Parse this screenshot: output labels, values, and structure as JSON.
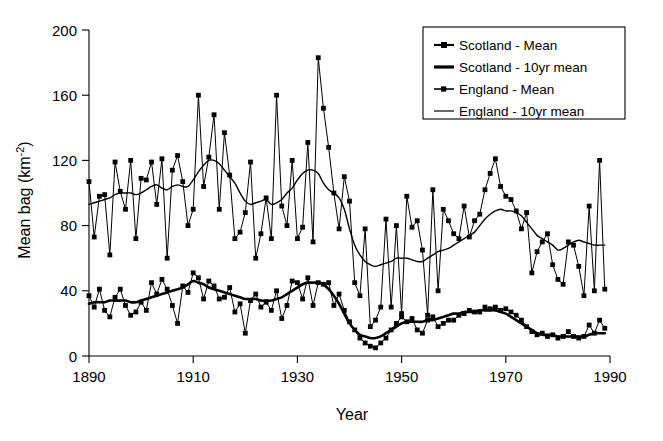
{
  "chart_data": {
    "type": "line",
    "title": "",
    "xlabel": "Year",
    "ylabel": "Mean bag (km⁻²)",
    "xlim": [
      1890,
      1990
    ],
    "ylim": [
      0,
      200
    ],
    "xticks": [
      1890,
      1910,
      1930,
      1950,
      1970,
      1990
    ],
    "yticks": [
      0,
      40,
      80,
      120,
      160,
      200
    ],
    "grid": false,
    "legend_position": "top-right",
    "legend": [
      "Scotland - Mean",
      "Scotland - 10yr mean",
      "England - Mean",
      "England - 10yr mean"
    ],
    "x": [
      1890,
      1891,
      1892,
      1893,
      1894,
      1895,
      1896,
      1897,
      1898,
      1899,
      1900,
      1901,
      1902,
      1903,
      1904,
      1905,
      1906,
      1907,
      1908,
      1909,
      1910,
      1911,
      1912,
      1913,
      1914,
      1915,
      1916,
      1917,
      1918,
      1919,
      1920,
      1921,
      1922,
      1923,
      1924,
      1925,
      1926,
      1927,
      1928,
      1929,
      1930,
      1931,
      1932,
      1933,
      1934,
      1935,
      1936,
      1937,
      1938,
      1939,
      1940,
      1941,
      1942,
      1943,
      1944,
      1945,
      1946,
      1947,
      1948,
      1949,
      1950,
      1951,
      1952,
      1953,
      1954,
      1955,
      1956,
      1957,
      1958,
      1959,
      1960,
      1961,
      1962,
      1963,
      1964,
      1965,
      1966,
      1967,
      1968,
      1969,
      1970,
      1971,
      1972,
      1973,
      1974,
      1975,
      1976,
      1977,
      1978,
      1979,
      1980,
      1981,
      1982,
      1983,
      1984,
      1985,
      1986,
      1987,
      1988,
      1989
    ],
    "series": [
      {
        "name": "England - Mean",
        "marker": "square",
        "line_width": "thin",
        "values": [
          107,
          73,
          98,
          99,
          62,
          119,
          101,
          90,
          120,
          72,
          109,
          108,
          119,
          93,
          121,
          60,
          114,
          123,
          107,
          80,
          90,
          160,
          104,
          122,
          148,
          90,
          137,
          111,
          72,
          76,
          88,
          119,
          60,
          75,
          97,
          72,
          160,
          92,
          80,
          120,
          72,
          79,
          131,
          70,
          183,
          152,
          128,
          100,
          78,
          110,
          95,
          45,
          37,
          78,
          18,
          22,
          30,
          84,
          30,
          80,
          26,
          98,
          79,
          83,
          65,
          25,
          102,
          40,
          90,
          83,
          75,
          72,
          92,
          73,
          83,
          87,
          102,
          112,
          121,
          104,
          98,
          96,
          89,
          78,
          88,
          51,
          64,
          70,
          75,
          56,
          47,
          44,
          70,
          68,
          55,
          37,
          92,
          40,
          120,
          41
        ]
      },
      {
        "name": "England - 10yr mean",
        "marker": "none",
        "line_width": "thin",
        "values": [
          93,
          94,
          95,
          96,
          97,
          99,
          100,
          100,
          100,
          99,
          100,
          102,
          104,
          105,
          103,
          102,
          104,
          105,
          104,
          104,
          108,
          113,
          117,
          120,
          120,
          118,
          114,
          110,
          106,
          100,
          95,
          93,
          94,
          95,
          96,
          93,
          94,
          96,
          100,
          103,
          108,
          112,
          114,
          114,
          112,
          106,
          102,
          100,
          97,
          90,
          78,
          68,
          62,
          58,
          56,
          55,
          56,
          57,
          58,
          60,
          60,
          60,
          59,
          58,
          58,
          60,
          62,
          64,
          65,
          66,
          68,
          70,
          72,
          74,
          76,
          80,
          84,
          87,
          89,
          90,
          89,
          89,
          88,
          86,
          82,
          78,
          74,
          72,
          70,
          68,
          65,
          66,
          68,
          70,
          71,
          70,
          69,
          68,
          68,
          68
        ]
      },
      {
        "name": "Scotland - Mean",
        "marker": "square",
        "line_width": "thin",
        "values": [
          37,
          30,
          41,
          28,
          24,
          36,
          41,
          31,
          25,
          27,
          33,
          28,
          45,
          38,
          47,
          41,
          31,
          20,
          43,
          39,
          51,
          48,
          35,
          46,
          43,
          35,
          36,
          42,
          27,
          32,
          14,
          34,
          38,
          30,
          33,
          28,
          40,
          23,
          31,
          46,
          45,
          35,
          48,
          31,
          45,
          44,
          45,
          31,
          38,
          28,
          21,
          16,
          11,
          8,
          6,
          5,
          8,
          11,
          16,
          20,
          24,
          21,
          23,
          16,
          14,
          22,
          24,
          18,
          20,
          22,
          22,
          25,
          26,
          28,
          27,
          27,
          30,
          29,
          30,
          28,
          29,
          27,
          25,
          22,
          18,
          15,
          13,
          14,
          12,
          13,
          11,
          12,
          15,
          12,
          11,
          12,
          19,
          14,
          22,
          17
        ]
      },
      {
        "name": "Scotland - 10yr mean",
        "marker": "none",
        "line_width": "thick",
        "values": [
          32,
          33,
          33,
          33,
          34,
          34,
          34,
          34,
          33,
          33,
          34,
          35,
          36,
          37,
          38,
          39,
          40,
          41,
          42,
          44,
          46,
          45,
          44,
          42,
          41,
          40,
          39,
          38,
          37,
          36,
          35,
          35,
          35,
          34,
          34,
          34,
          35,
          36,
          38,
          40,
          42,
          44,
          45,
          45,
          45,
          44,
          41,
          37,
          32,
          26,
          20,
          16,
          13,
          12,
          11,
          11,
          12,
          14,
          16,
          18,
          20,
          21,
          21,
          21,
          21,
          22,
          22,
          23,
          24,
          25,
          26,
          26,
          27,
          27,
          27,
          28,
          28,
          28,
          28,
          27,
          26,
          24,
          22,
          20,
          18,
          16,
          14,
          13,
          13,
          13,
          12,
          12,
          12,
          12,
          12,
          12,
          13,
          14,
          14,
          14
        ]
      }
    ]
  },
  "axes": {
    "ylabel": "Mean bag (km",
    "ylabel_sup": "-2",
    "ylabel_tail": ")",
    "xlabel": "Year",
    "ytick_labels": [
      "200",
      "160",
      "120",
      "80",
      "40",
      "0"
    ],
    "xtick_labels": [
      "1890",
      "1910",
      "1930",
      "1950",
      "1970",
      "1990"
    ]
  },
  "legend": {
    "items": [
      {
        "label": "Scotland - Mean",
        "style": "marker-line-thick"
      },
      {
        "label": "Scotland - 10yr mean",
        "style": "line-thick"
      },
      {
        "label": "England - Mean",
        "style": "marker-line-thin"
      },
      {
        "label": "England - 10yr mean",
        "style": "line-thin"
      }
    ]
  },
  "colors": {
    "foreground": "#000000",
    "background": "#ffffff"
  }
}
